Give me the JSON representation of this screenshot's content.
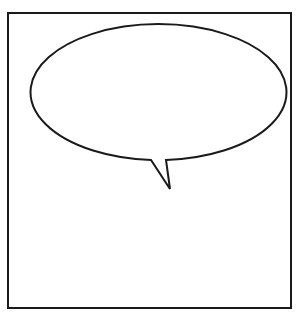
{
  "panel": {
    "border_color": "#1a1a1a",
    "background": "#ffffff"
  },
  "speech_bubble": {
    "text": "",
    "stroke_color": "#1a1a1a",
    "fill_color": "#ffffff"
  }
}
